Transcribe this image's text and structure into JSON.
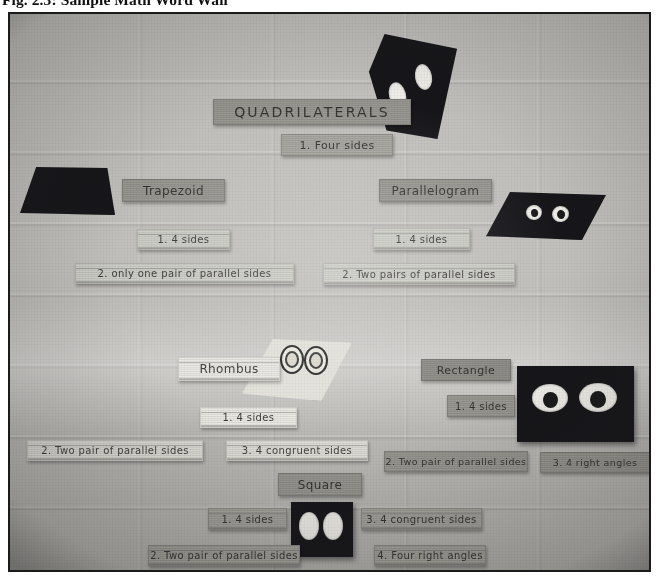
{
  "figure": {
    "caption": "Fig. 2.3: Sample Math Word Wall",
    "alt": "photograph of a classroom cinder-block wall displaying a quadrilaterals word wall"
  },
  "wall": {
    "title": "QUADRILATERALS",
    "title_rule": "1. Four sides",
    "sections": [
      {
        "name": "trapezoid",
        "label": "Trapezoid",
        "shape": "trapezoid-cutout",
        "properties": [
          "1. 4 sides",
          "2. only one pair of parallel sides"
        ]
      },
      {
        "name": "parallelogram",
        "label": "Parallelogram",
        "shape": "parallelogram-cutout",
        "properties": [
          "1. 4 sides",
          "2. Two pairs of parallel sides"
        ]
      },
      {
        "name": "rhombus",
        "label": "Rhombus",
        "shape": "rhombus-cutout",
        "properties": [
          "1. 4 sides",
          "2. Two pair of parallel sides",
          "3. 4 congruent sides"
        ]
      },
      {
        "name": "rectangle",
        "label": "Rectangle",
        "shape": "rectangle-cutout",
        "properties": [
          "1. 4 sides",
          "2. Two pair of parallel sides",
          "3. 4 right angles"
        ]
      },
      {
        "name": "square",
        "label": "Square",
        "shape": "square-cutout",
        "properties": [
          "1. 4 sides",
          "3. 4 congruent sides",
          "2. Two pair of parallel sides",
          "4. Four right angles"
        ]
      }
    ]
  },
  "colors": {
    "wall": "#bab9b5",
    "card_grey": "#95948e",
    "card_light": "#ccccc6",
    "card_white": "#e9e8e2",
    "cutout_dark": "#16161a",
    "frame": "#1b1b1b"
  }
}
